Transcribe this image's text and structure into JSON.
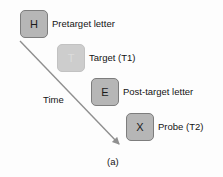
{
  "figure": {
    "caption": "(a)",
    "axis_label": "Time",
    "background_color": "#fdfdfd"
  },
  "colors": {
    "box_fill": "#b6b6b6",
    "box_border": "#7d7d7d",
    "box_fill_faded": "#cdcdcd",
    "box_border_faded": "#c2c2c2",
    "letter_color": "#1b1b1b",
    "letter_color_faded": "#dcdcdc",
    "arrow_color": "#8f8f8f",
    "text_color": "#141414"
  },
  "sequence": [
    {
      "letter": "H",
      "label": "Pretarget letter",
      "state": "solid",
      "box": {
        "x": 20,
        "y": 10,
        "w": 28,
        "h": 28
      },
      "label_pos": {
        "x": 52,
        "y": 19
      }
    },
    {
      "letter": "T",
      "label": "Target (T1)",
      "state": "faded",
      "box": {
        "x": 57,
        "y": 44,
        "w": 28,
        "h": 28
      },
      "label_pos": {
        "x": 89,
        "y": 53
      }
    },
    {
      "letter": "E",
      "label": "Post-target letter",
      "state": "solid",
      "box": {
        "x": 91,
        "y": 78,
        "w": 28,
        "h": 28
      },
      "label_pos": {
        "x": 123,
        "y": 87
      }
    },
    {
      "letter": "X",
      "label": "Probe (T2)",
      "state": "solid",
      "box": {
        "x": 126,
        "y": 113,
        "w": 28,
        "h": 28
      },
      "label_pos": {
        "x": 158,
        "y": 122
      }
    }
  ],
  "arrow": {
    "name": "time-arrow",
    "x1": 20,
    "y1": 41,
    "x2": 122,
    "y2": 147,
    "color": "#8f8f8f",
    "width": 1.4
  },
  "time_label_pos": {
    "x": 43,
    "y": 95
  },
  "caption_pos": {
    "x": 107,
    "y": 157
  }
}
